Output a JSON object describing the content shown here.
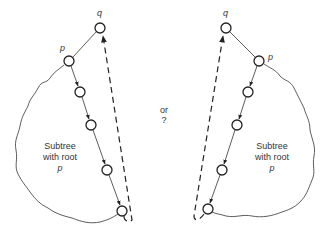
{
  "diagram": {
    "middle_text": {
      "line1": "or",
      "line2": "?"
    },
    "left": {
      "node_q_label": "q",
      "node_p_label": "p",
      "subtree_label": {
        "line1": "Subtree",
        "line2": "with root",
        "line3": "p"
      }
    },
    "right": {
      "node_q_label": "q",
      "node_p_label": "p",
      "subtree_label": {
        "line1": "Subtree",
        "line2": "with root",
        "line3": "p"
      }
    }
  }
}
